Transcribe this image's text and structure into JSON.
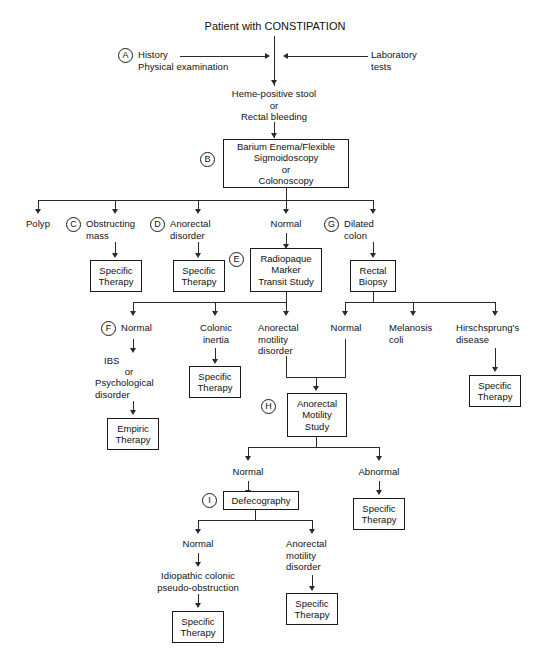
{
  "diagram": {
    "title": "Patient with CONSTIPATION",
    "markers": {
      "a": "A",
      "b": "B",
      "c": "C",
      "d": "D",
      "e": "E",
      "f": "F",
      "g": "G",
      "h": "H",
      "i": "I"
    },
    "nodes": {
      "history": "History\nPhysical examination",
      "lab_tests": "Laboratory\ntests",
      "heme": "Heme-positive stool\nor\nRectal bleeding",
      "barium": "Barium Enema/Flexible\nSigmoidoscopy\nor\nColonoscopy",
      "polyp": "Polyp",
      "obstructing_mass": "Obstructing\nmass",
      "anorectal_disorder": "Anorectal\ndisorder",
      "normal_top": "Normal",
      "dilated_colon": "Dilated\ncolon",
      "specific_therapy_c": "Specific\nTherapy",
      "specific_therapy_d": "Specific\nTherapy",
      "radiopaque": "Radiopaque\nMarker\nTransit Study",
      "rectal_biopsy": "Rectal\nBiopsy",
      "normal_f": "Normal",
      "colonic_inertia": "Colonic\ninertia",
      "anorectal_motility_disorder": "Anorectal\nmotility\ndisorder",
      "normal_biopsy": "Normal",
      "melanosis_coli": "Melanosis\ncoli",
      "hirschsprung": "Hirschsprung's\ndisease",
      "ibs": "IBS",
      "or": "or",
      "psychological": "Psychological\ndisorder",
      "specific_therapy_inertia": "Specific\nTherapy",
      "specific_therapy_hirsch": "Specific\nTherapy",
      "empiric_therapy": "Empiric\nTherapy",
      "anorectal_motility_study": "Anorectal\nMotility\nStudy",
      "normal_h": "Normal",
      "abnormal_h": "Abnormal",
      "specific_therapy_abnormal": "Specific\nTherapy",
      "defecography": "Defecography",
      "normal_i": "Normal",
      "anorectal_motility_disorder_i": "Anorectal\nmotility\ndisorder",
      "idiopathic": "Idiopathic colonic\npseudo-obstruction",
      "specific_therapy_idio": "Specific\nTherapy",
      "specific_therapy_amd": "Specific\nTherapy"
    },
    "colors": {
      "line": "#2a2a2a",
      "border": "#1a1a1a",
      "text": "#111111",
      "background": "#ffffff"
    }
  }
}
